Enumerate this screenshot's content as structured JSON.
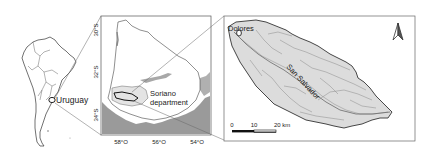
{
  "figure": {
    "panel_overview": {
      "country_label": "Uruguay"
    },
    "panel_country": {
      "region_label_line1": "Soriano",
      "region_label_line2": "department",
      "lat_ticks": [
        "30°S",
        "32°S",
        "34°S"
      ],
      "lon_ticks": [
        "58°O",
        "56°O",
        "54°O"
      ]
    },
    "panel_basin": {
      "town_label": "Dolores",
      "river_label": "San Salvador",
      "north_arrow": "north-arrow",
      "scale_bar": {
        "ticks": [
          "0",
          "10",
          "20 km"
        ]
      }
    },
    "colors": {
      "land": "#ffffff",
      "outline": "#333333",
      "sea_gray": "#9a9a9a",
      "basin_fill": "#dcdcdc",
      "river": "#8a8a8a",
      "soriano_fill": "#e6e6e6",
      "frame": "#555555"
    }
  }
}
